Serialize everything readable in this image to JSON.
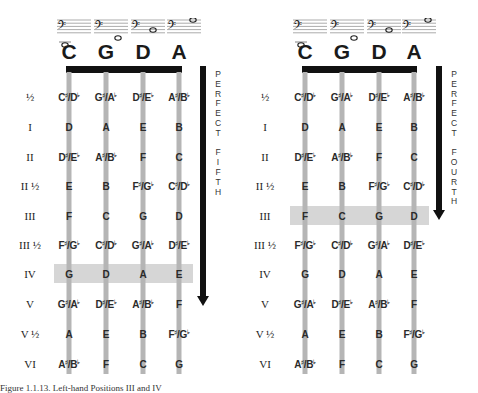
{
  "left_panel": {
    "strings": [
      "C",
      "G",
      "D",
      "A"
    ],
    "interval_label": "PERFECT FIFTH",
    "highlighted_position": "IV",
    "positions": [
      {
        "label": "½",
        "notes": [
          "C♯/D♭",
          "G♯/A♭",
          "D♯/E♭",
          "A♯/B♭"
        ]
      },
      {
        "label": "I",
        "notes": [
          "D",
          "A",
          "E",
          "B"
        ]
      },
      {
        "label": "II",
        "notes": [
          "D♯/E♭",
          "A♯/B♭",
          "F",
          "C"
        ]
      },
      {
        "label": "II ½",
        "notes": [
          "E",
          "B",
          "F♯/G♭",
          "C♯/D♭"
        ]
      },
      {
        "label": "III",
        "notes": [
          "F",
          "C",
          "G",
          "D"
        ]
      },
      {
        "label": "III ½",
        "notes": [
          "F♯/G♭",
          "C♯/D♭",
          "G♯/A♭",
          "D♯/E♭"
        ]
      },
      {
        "label": "IV",
        "notes": [
          "G",
          "D",
          "A",
          "E"
        ]
      },
      {
        "label": "V",
        "notes": [
          "G♯/A♭",
          "D♯/E♭",
          "A♯/B♭",
          "F"
        ]
      },
      {
        "label": "V ½",
        "notes": [
          "A",
          "E",
          "B",
          "F♯/G♭"
        ]
      },
      {
        "label": "VI",
        "notes": [
          "A♯/B♭",
          "F",
          "C",
          "G"
        ]
      }
    ]
  },
  "right_panel": {
    "strings": [
      "C",
      "G",
      "D",
      "A"
    ],
    "interval_label": "PERFECT FOURTH",
    "highlighted_position": "III",
    "positions": [
      {
        "label": "½",
        "notes": [
          "C♯/D♭",
          "G♯/A♭",
          "D♯/E♭",
          "A♯/B♭"
        ]
      },
      {
        "label": "I",
        "notes": [
          "D",
          "A",
          "E",
          "B"
        ]
      },
      {
        "label": "II",
        "notes": [
          "D♯/E♭",
          "A♯/B♭",
          "F",
          "C"
        ]
      },
      {
        "label": "II ½",
        "notes": [
          "E",
          "B",
          "F♯/G♭",
          "C♯/D♭"
        ]
      },
      {
        "label": "III",
        "notes": [
          "F",
          "C",
          "G",
          "D"
        ]
      },
      {
        "label": "III ½",
        "notes": [
          "F♯/G♭",
          "C♯/D♭",
          "G♯/A♭",
          "D♯/E♭"
        ]
      },
      {
        "label": "IV",
        "notes": [
          "G",
          "D",
          "A",
          "E"
        ]
      },
      {
        "label": "V",
        "notes": [
          "G♯/A♭",
          "D♯/E♭",
          "A♯/B♭",
          "F"
        ]
      },
      {
        "label": "V ½",
        "notes": [
          "A",
          "E",
          "B",
          "F♯/G♭"
        ]
      },
      {
        "label": "VI",
        "notes": [
          "A♯/B♭",
          "F",
          "C",
          "G"
        ]
      }
    ]
  },
  "caption": "Figure 1.1.13. Left-hand Positions III and IV"
}
